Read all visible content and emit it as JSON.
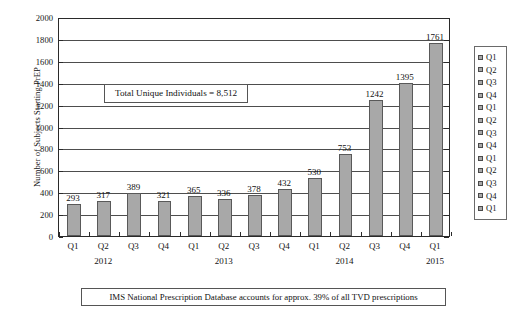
{
  "chart_data": {
    "type": "bar",
    "title": "",
    "xlabel": "",
    "ylabel": "Number of Subjects Starting PrEP",
    "ylim": [
      0,
      2000
    ],
    "ytick_step": 200,
    "ytick_labels": [
      "0",
      "200",
      "400",
      "600",
      "800",
      "1000",
      "1200",
      "1400",
      "1600",
      "1800",
      "2000"
    ],
    "grid": true,
    "legend_position": "right",
    "categories": [
      "Q1",
      "Q2",
      "Q3",
      "Q4",
      "Q1",
      "Q2",
      "Q3",
      "Q4",
      "Q1",
      "Q2",
      "Q3",
      "Q4",
      "Q1"
    ],
    "values": [
      293,
      317,
      389,
      321,
      365,
      336,
      378,
      432,
      530,
      753,
      1242,
      1395,
      1761
    ],
    "value_labels": [
      "293",
      "317",
      "389",
      "321",
      "365",
      "336",
      "378",
      "432",
      "530",
      "753",
      "1242",
      "1395",
      "1761"
    ],
    "group_labels": [
      {
        "text": "2012",
        "index": 1
      },
      {
        "text": "2013",
        "index": 5
      },
      {
        "text": "2014",
        "index": 9
      },
      {
        "text": "2015",
        "index": 12
      }
    ],
    "legend_entries": [
      "Q1",
      "Q2",
      "Q3",
      "Q4",
      "Q1",
      "Q2",
      "Q3",
      "Q4",
      "Q1",
      "Q2",
      "Q3",
      "Q4",
      "Q1"
    ],
    "annotation": "Total Unique Individuals = 8,512",
    "caption": "IMS National Prescription Database accounts for approx. 39% of all TVD prescriptions",
    "bar_color": "#a8a8a8",
    "bar_border_color": "#595959",
    "axis_color": "#2a2a2a",
    "grid_color": "#4d4d4d"
  }
}
